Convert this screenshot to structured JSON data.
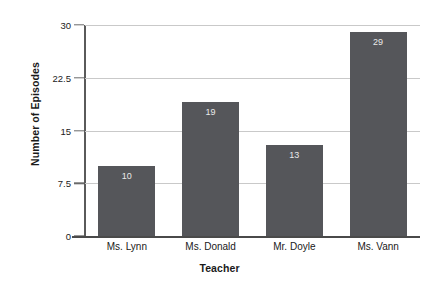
{
  "chart_data": {
    "type": "bar",
    "title": "",
    "xlabel": "Teacher",
    "ylabel": "Number of Episodes",
    "categories": [
      "Ms. Lynn",
      "Ms. Donald",
      "Mr. Doyle",
      "Ms. Vann"
    ],
    "values": [
      10,
      19,
      13,
      29
    ],
    "value_labels": [
      "10",
      "19",
      "13",
      "29"
    ],
    "ylim": [
      0,
      30
    ],
    "yticks": [
      0,
      7.5,
      15,
      22.5,
      30
    ],
    "ytick_labels": [
      "0",
      "7.5",
      "15",
      "22.5",
      "30"
    ],
    "grid": true,
    "legend": "none",
    "colors": {
      "bar": "#55565a",
      "gridline": "#c9c9c9",
      "axis": "#4a4a4a",
      "text": "#1a1a1a",
      "bar_label": "#e9e9e9",
      "background": "#ffffff"
    }
  }
}
